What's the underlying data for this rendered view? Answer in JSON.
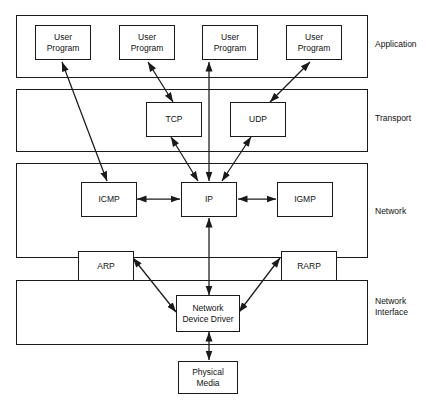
{
  "diagram": {
    "background_color": "#ffffff",
    "line_color": "#1a1a1a",
    "text_color": "#111111",
    "layers": [
      {
        "id": "application",
        "label": "Application",
        "label_lines": [
          "Application"
        ],
        "nodes": [
          {
            "id": "user-program-1",
            "label_lines": [
              "User",
              "Program"
            ]
          },
          {
            "id": "user-program-2",
            "label_lines": [
              "User",
              "Program"
            ]
          },
          {
            "id": "user-program-3",
            "label_lines": [
              "User",
              "Program"
            ]
          },
          {
            "id": "user-program-4",
            "label_lines": [
              "User",
              "Program"
            ]
          }
        ]
      },
      {
        "id": "transport",
        "label": "Transport",
        "label_lines": [
          "Transport"
        ],
        "nodes": [
          {
            "id": "tcp",
            "label_lines": [
              "TCP"
            ]
          },
          {
            "id": "udp",
            "label_lines": [
              "UDP"
            ]
          }
        ]
      },
      {
        "id": "network",
        "label": "Network",
        "label_lines": [
          "Network"
        ],
        "nodes": [
          {
            "id": "icmp",
            "label_lines": [
              "ICMP"
            ]
          },
          {
            "id": "ip",
            "label_lines": [
              "IP"
            ]
          },
          {
            "id": "igmp",
            "label_lines": [
              "IGMP"
            ]
          }
        ]
      },
      {
        "id": "network-interface",
        "label": "Network Interface",
        "label_lines": [
          "Network",
          "Interface"
        ],
        "nodes": [
          {
            "id": "arp",
            "label_lines": [
              "ARP"
            ]
          },
          {
            "id": "rarp",
            "label_lines": [
              "RARP"
            ]
          },
          {
            "id": "network-device-driver",
            "label_lines": [
              "Network",
              "Device Driver"
            ]
          }
        ]
      }
    ],
    "external_nodes": [
      {
        "id": "physical-media",
        "label_lines": [
          "Physical",
          "Media"
        ]
      }
    ],
    "connections": [
      {
        "from": "user-program-1",
        "to": "icmp",
        "arrow": "both"
      },
      {
        "from": "user-program-2",
        "to": "tcp",
        "arrow": "both"
      },
      {
        "from": "user-program-3",
        "to": "ip",
        "arrow": "both"
      },
      {
        "from": "user-program-4",
        "to": "udp",
        "arrow": "both"
      },
      {
        "from": "tcp",
        "to": "ip",
        "arrow": "both"
      },
      {
        "from": "udp",
        "to": "ip",
        "arrow": "both"
      },
      {
        "from": "icmp",
        "to": "ip",
        "arrow": "both"
      },
      {
        "from": "ip",
        "to": "igmp",
        "arrow": "both"
      },
      {
        "from": "ip",
        "to": "network-device-driver",
        "arrow": "both"
      },
      {
        "from": "arp",
        "to": "network-device-driver",
        "arrow": "both"
      },
      {
        "from": "rarp",
        "to": "network-device-driver",
        "arrow": "both"
      },
      {
        "from": "network-device-driver",
        "to": "physical-media",
        "arrow": "both"
      }
    ]
  }
}
